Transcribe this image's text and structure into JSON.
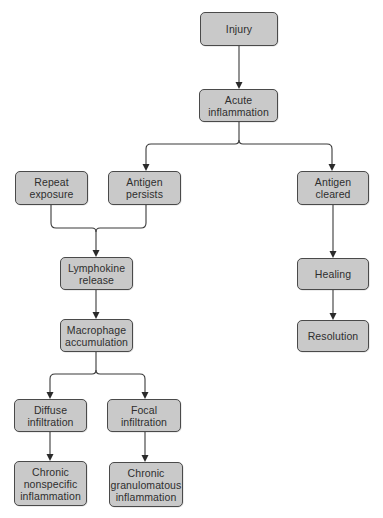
{
  "diagram": {
    "type": "flowchart",
    "nodes": {
      "injury": {
        "label": "Injury"
      },
      "acute_inflammation": {
        "label": "Acute\ninflammation"
      },
      "repeat_exposure": {
        "label": "Repeat\nexposure"
      },
      "antigen_persists": {
        "label": "Antigen\npersists"
      },
      "antigen_cleared": {
        "label": "Antigen\ncleared"
      },
      "lymphokine_release": {
        "label": "Lymphokine\nrelease"
      },
      "healing": {
        "label": "Healing"
      },
      "macrophage_accumulation": {
        "label": "Macrophage\naccumulation"
      },
      "resolution": {
        "label": "Resolution"
      },
      "diffuse_infiltration": {
        "label": "Diffuse\ninfiltration"
      },
      "focal_infiltration": {
        "label": "Focal\ninfiltration"
      },
      "chronic_nonspecific_inflammation": {
        "label": "Chronic\nnonspecific\ninflammation"
      },
      "chronic_granulomatous_inflammation": {
        "label": "Chronic\ngranulomatous\ninflammation"
      }
    },
    "edges": [
      {
        "from": "injury",
        "to": "acute_inflammation"
      },
      {
        "from": "acute_inflammation",
        "to": "antigen_persists"
      },
      {
        "from": "acute_inflammation",
        "to": "antigen_cleared"
      },
      {
        "from": "repeat_exposure",
        "to": "lymphokine_release"
      },
      {
        "from": "antigen_persists",
        "to": "lymphokine_release"
      },
      {
        "from": "lymphokine_release",
        "to": "macrophage_accumulation"
      },
      {
        "from": "macrophage_accumulation",
        "to": "diffuse_infiltration"
      },
      {
        "from": "macrophage_accumulation",
        "to": "focal_infiltration"
      },
      {
        "from": "diffuse_infiltration",
        "to": "chronic_nonspecific_inflammation"
      },
      {
        "from": "focal_infiltration",
        "to": "chronic_granulomatous_inflammation"
      },
      {
        "from": "antigen_cleared",
        "to": "healing"
      },
      {
        "from": "healing",
        "to": "resolution"
      }
    ],
    "colors": {
      "node_fill": "#c9c9c9",
      "node_border": "#4a4a4a",
      "text": "#2e2e2e",
      "edge": "#3a3a3a",
      "background": "#ffffff"
    }
  }
}
